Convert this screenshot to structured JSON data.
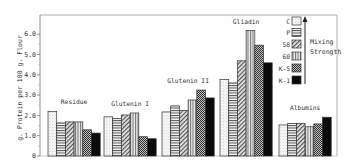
{
  "chart_data": {
    "type": "bar",
    "title": "",
    "xlabel": "",
    "ylabel": "g. Protein per 100 g. Flour",
    "ylim": [
      0,
      6.6
    ],
    "yticks": [
      0,
      1.0,
      2.0,
      3.0,
      4.0,
      5.0,
      6.0
    ],
    "ytick_labels": [
      "0",
      "1.0",
      "2.0",
      "3.0",
      "4.0",
      "5.0",
      "6.0"
    ],
    "grid": false,
    "legend_position": "upper right",
    "legend_annotation": "Mixing Strength",
    "categories": [
      "Residue",
      "Glutenin I",
      "Glutenin II",
      "Gliadin",
      "Albumins"
    ],
    "series": [
      {
        "name": "C",
        "pattern": "dotted-light",
        "values": [
          2.2,
          1.93,
          2.17,
          3.77,
          1.53
        ]
      },
      {
        "name": "P",
        "pattern": "horizontal-lines",
        "values": [
          1.63,
          1.85,
          2.47,
          3.6,
          1.6
        ]
      },
      {
        "name": "58",
        "pattern": "diagonal-hatch",
        "values": [
          1.68,
          2.02,
          2.24,
          4.69,
          1.6
        ]
      },
      {
        "name": "60",
        "pattern": "vertical-lines",
        "values": [
          1.68,
          2.12,
          2.76,
          6.18,
          1.44
        ]
      },
      {
        "name": "K-5",
        "pattern": "crosshatch",
        "values": [
          1.29,
          0.95,
          3.25,
          5.46,
          1.58
        ]
      },
      {
        "name": "K-1",
        "pattern": "solid-black",
        "values": [
          1.13,
          0.85,
          2.86,
          4.59,
          1.91
        ]
      }
    ]
  }
}
